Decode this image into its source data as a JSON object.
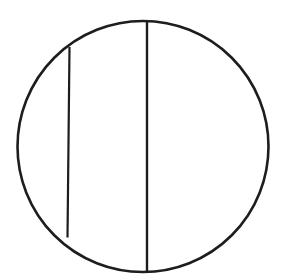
{
  "figure": {
    "background_color": "#ffffff",
    "stroke_color": "#1d1d1d",
    "canvas": {
      "width": 286,
      "height": 280
    },
    "shapes": {
      "circle": {
        "name": "outer-circle",
        "center_x": 143,
        "center_y": 146.5,
        "radius": 125.5,
        "stroke_width": 2.6
      },
      "diameter_chord": {
        "name": "center-vertical-chord",
        "x1": 147,
        "y1": 21.5,
        "x2": 147,
        "y2": 271.5,
        "stroke_width": 2.4
      },
      "left_chord": {
        "name": "left-vertical-chord",
        "x1": 69.5,
        "y1": 47,
        "x2": 67.5,
        "y2": 237.5,
        "stroke_width": 2.2
      }
    }
  }
}
